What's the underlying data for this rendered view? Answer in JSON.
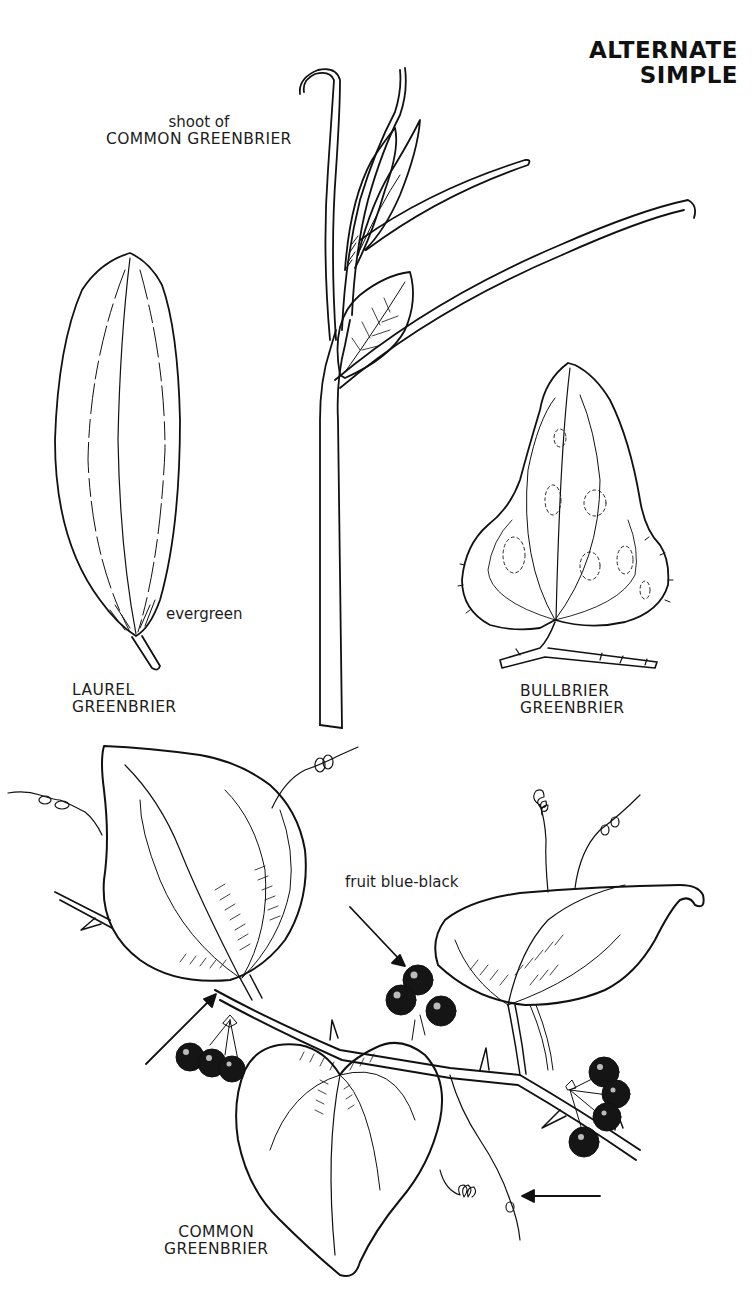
{
  "page": {
    "title_lines": [
      "ALTERNATE",
      "SIMPLE"
    ]
  },
  "specimens": [
    {
      "id": "shoot",
      "caption_lines": [
        "shoot of",
        "COMMON GREENBRIER"
      ]
    },
    {
      "id": "laurel",
      "note": "evergreen",
      "caption_lines": [
        "LAUREL",
        "GREENBRIER"
      ]
    },
    {
      "id": "bullbrier",
      "caption_lines": [
        "BULLBRIER",
        "GREENBRIER"
      ]
    },
    {
      "id": "common",
      "note": "fruit blue-black",
      "caption_lines": [
        "COMMON",
        "GREENBRIER"
      ]
    }
  ],
  "colors": {
    "ink": "#111111",
    "paper": "#ffffff"
  }
}
